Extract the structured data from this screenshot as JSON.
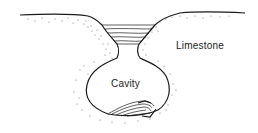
{
  "diagram": {
    "type": "geological cross-section",
    "labels": {
      "limestone": "Limestone",
      "cavity": "Cavity"
    },
    "colors": {
      "line": "#1a1a1a",
      "stipple": "#555555",
      "background": "#ffffff"
    },
    "elements": [
      "ground-surface",
      "sinkhole-sediment-fill",
      "cavity-neck",
      "cavity",
      "cavity-floor-sediment",
      "limestone-stipple"
    ]
  }
}
